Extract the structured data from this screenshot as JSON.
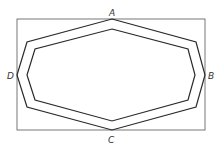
{
  "diagram": {
    "type": "geometric-figure",
    "labels": {
      "top": "A",
      "right": "B",
      "bottom": "C",
      "left": "D"
    },
    "colors": {
      "stroke": "#2a2a2a",
      "rect_stroke": "#555555",
      "label": "#333333",
      "background": "#ffffff"
    },
    "rectangle": {
      "x": 17,
      "y": 19,
      "width": 188,
      "height": 111
    },
    "outer_octagon": "112,19 196,42 205,75 196,107 112,130 27,107 17,75 27,42",
    "inner_octagon": "112,29 188,49 195,75 188,100 112,121 35,100 27,75 35,49"
  }
}
